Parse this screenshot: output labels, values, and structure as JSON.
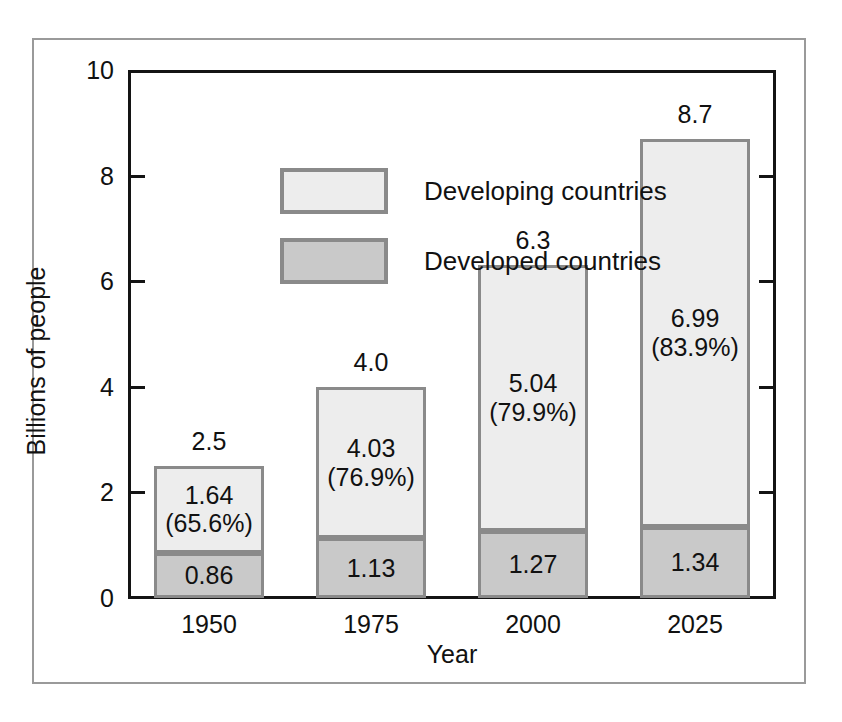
{
  "chart_data": {
    "type": "bar",
    "subtype": "stacked-bar",
    "title": "",
    "xlabel": "Year",
    "ylabel": "Billions of people",
    "ylim": [
      0,
      10
    ],
    "yticks": [
      0,
      2,
      4,
      6,
      8,
      10
    ],
    "ytick_labels": [
      "0",
      "2",
      "4",
      "6",
      "8",
      "10"
    ],
    "grid": false,
    "legend_position": "inside-top-left",
    "categories": [
      "1950",
      "1975",
      "2000",
      "2025"
    ],
    "series": [
      {
        "name": "Developed countries",
        "color": "#c9c9c9",
        "values": [
          0.86,
          1.13,
          1.27,
          1.34
        ],
        "labels": [
          "0.86",
          "1.13",
          "1.27",
          "1.34"
        ]
      },
      {
        "name": "Developing countries",
        "color": "#ededed",
        "values": [
          1.64,
          4.03,
          5.04,
          6.99
        ],
        "labels": [
          "1.64\n(65.6%)",
          "4.03\n(76.9%)",
          "5.04\n(79.9%)",
          "6.99\n(83.9%)"
        ],
        "percent_labels": [
          "65.6%",
          "76.9%",
          "79.9%",
          "83.9%"
        ]
      }
    ],
    "totals": [
      2.5,
      4.0,
      6.3,
      8.7
    ],
    "total_labels": [
      "2.5",
      "4.0",
      "6.3",
      "8.7"
    ],
    "colors": {
      "developing": "#ededed",
      "developed": "#c9c9c9",
      "bar_border": "#8a8a8a",
      "axis": "#141414",
      "frame": "#9a9a9a",
      "background": "#ffffff",
      "text": "#111111"
    }
  },
  "legend": {
    "items": [
      {
        "label": "Developing countries",
        "swatch": "developing"
      },
      {
        "label": "Developed countries",
        "swatch": "developed"
      }
    ]
  },
  "axes": {
    "y_title": "Billions of people",
    "x_title": "Year"
  }
}
